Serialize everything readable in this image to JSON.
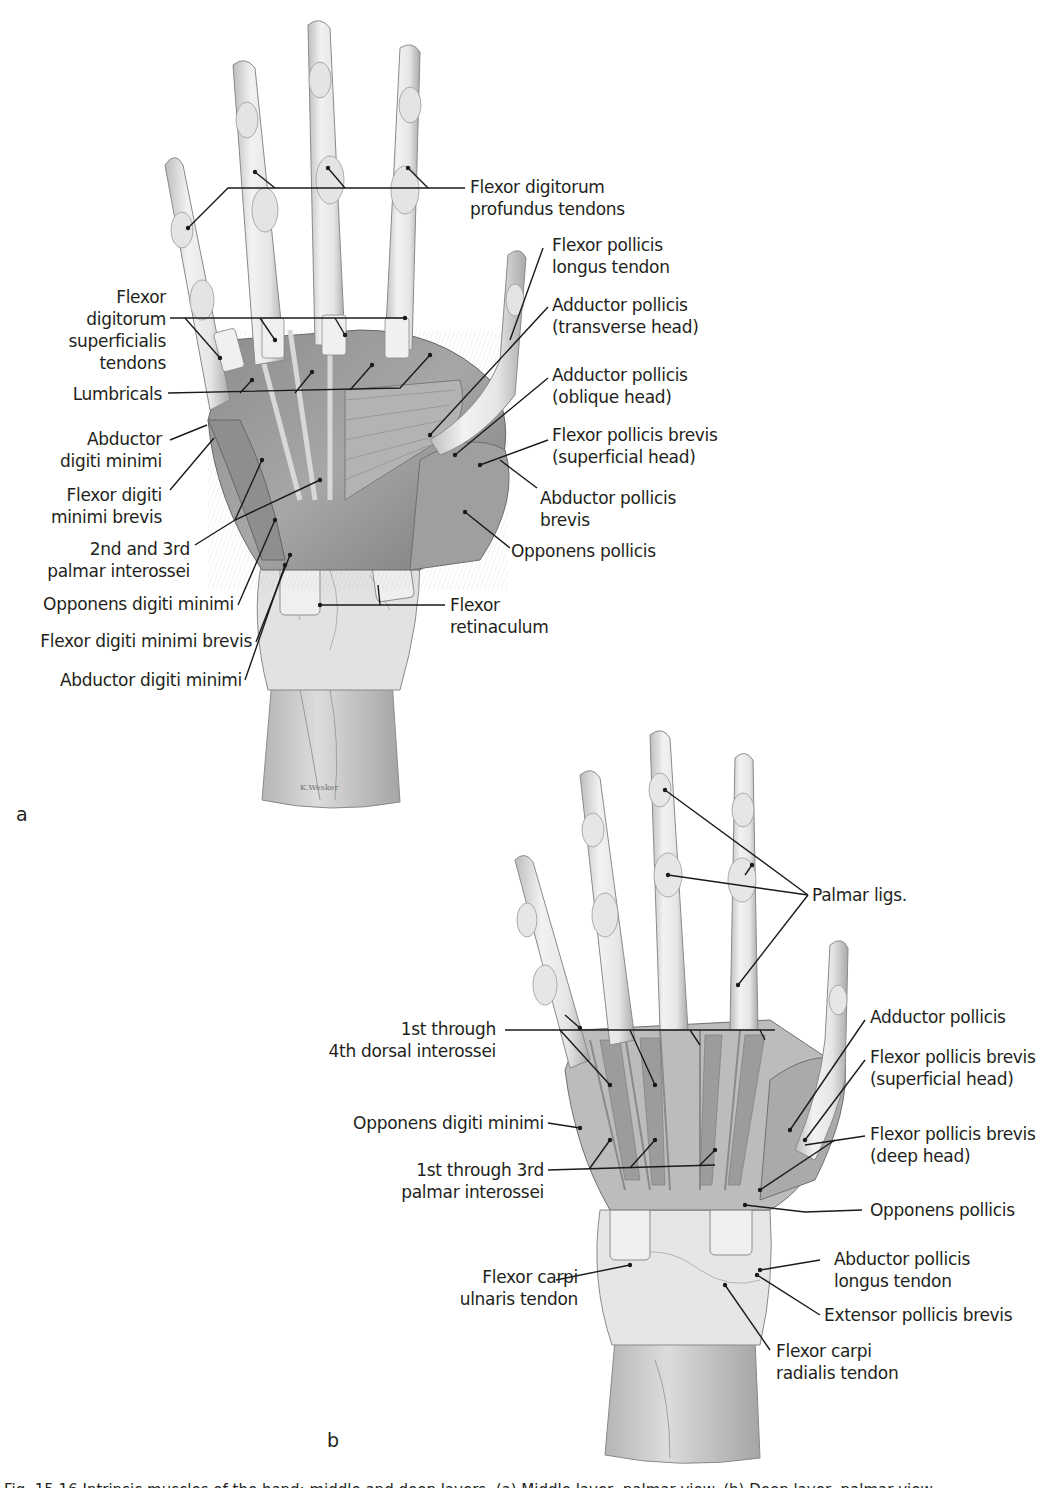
{
  "figure": {
    "panels": [
      {
        "letter": "a",
        "labels": {
          "fdp_tendons": "Flexor digitorum\nprofundus tendons",
          "fpl_tendon": "Flexor pollicis\nlongus tendon",
          "fds_tendons": "Flexor\ndigitorum\nsuperficialis\ntendons",
          "add_poll_transverse": "Adductor pollicis\n(transverse head)",
          "lumbricals": "Lumbricals",
          "add_poll_oblique": "Adductor pollicis\n(oblique head)",
          "abd_dig_min": "Abductor\ndigiti minimi",
          "fpb_superficial": "Flexor pollicis brevis\n(superficial head)",
          "fdmb": "Flexor digiti\nminimi brevis",
          "apb": "Abductor pollicis\nbrevis",
          "palmar_interossei_2_3": "2nd and 3rd\npalmar interossei",
          "opp_pollicis": "Opponens pollicis",
          "opp_dig_min": "Opponens digiti minimi",
          "flexor_retinaculum": "Flexor\nretinaculum",
          "fdmb_2": "Flexor digiti minimi brevis",
          "abd_dig_min_2": "Abductor digiti minimi"
        }
      },
      {
        "letter": "b",
        "labels": {
          "palmar_ligs": "Palmar ligs.",
          "dorsal_interossei": "1st through\n4th dorsal interossei",
          "add_pollicis": "Adductor pollicis",
          "fpb_superficial": "Flexor pollicis brevis\n(superficial head)",
          "opp_dig_min": "Opponens digiti minimi",
          "fpb_deep": "Flexor pollicis brevis\n(deep head)",
          "palmar_interossei": "1st through 3rd\npalmar interossei",
          "opp_pollicis": "Opponens pollicis",
          "fcu_tendon": "Flexor carpi\nulnaris tendon",
          "apl_tendon": "Abductor pollicis\nlongus tendon",
          "epb": "Extensor pollicis brevis",
          "fcr_tendon": "Flexor carpi\nradialis tendon"
        }
      }
    ],
    "caption": "Fig. 15.16 Intrinsic muscles of the hand: middle and deep layers. (a) Middle layer, palmar view. (b) Deep layer, palmar view.",
    "colors": {
      "ink": "#231f20",
      "leader": "#1a1a1a",
      "bone_light": "#ececec",
      "muscle": "#9a9a9a",
      "muscle_dark": "#6f6f6f"
    }
  }
}
